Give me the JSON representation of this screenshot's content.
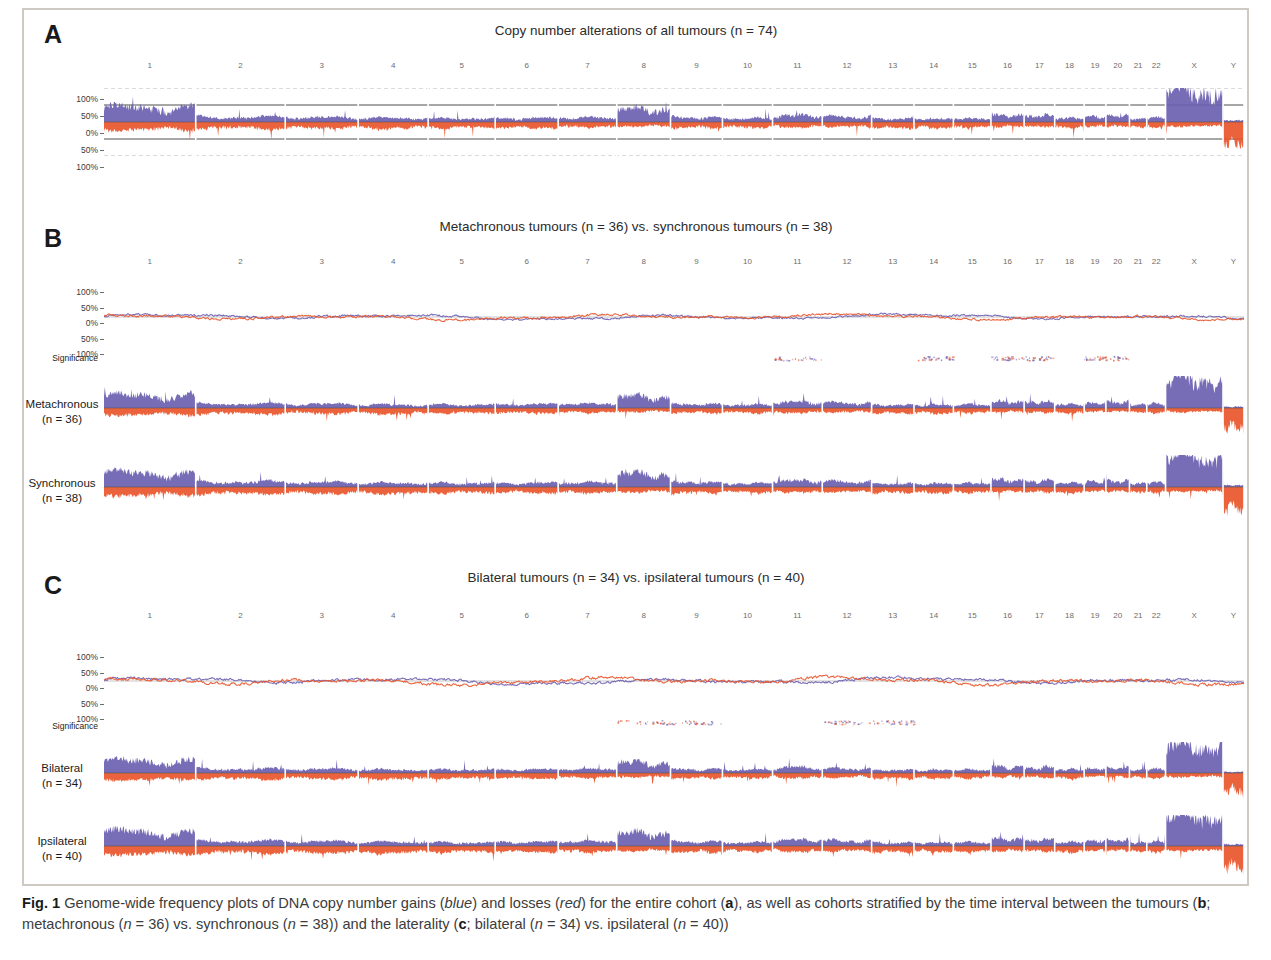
{
  "figure": {
    "caption_label": "Fig. 1",
    "caption_text_1": " Genome-wide frequency plots of DNA copy number gains (",
    "caption_blue": "blue",
    "caption_text_2": ") and losses (",
    "caption_red": "red",
    "caption_text_3": ") for the entire cohort (",
    "caption_a": "a",
    "caption_text_4": "), as well as cohorts stratified by the time interval between the tumours (",
    "caption_b": "b",
    "caption_text_5": "; metachronous (",
    "caption_n1": "n",
    "caption_text_6": " = 36) vs. synchronous (",
    "caption_n2": "n",
    "caption_text_7": " = 38)) and the laterality (",
    "caption_c": "c",
    "caption_text_8": "; bilateral (",
    "caption_n3": "n",
    "caption_text_9": " = 34) vs. ipsilateral (",
    "caption_n4": "n",
    "caption_text_10": " = 40))"
  },
  "colors": {
    "gain": "#6b5fb0",
    "loss": "#e8562d",
    "axis": "#6d6d6d",
    "gridline": "#4a4a4a",
    "text": "#231f20"
  },
  "panels": [
    {
      "letter": "A",
      "title": "Copy number alterations of all tumours (n = 74)",
      "y_labels": [
        "100%",
        "50%",
        "0%",
        "50%",
        "100%"
      ]
    },
    {
      "letter": "B",
      "title": "Metachronous tumours (n = 36) vs. synchronous tumours (n = 38)",
      "y_labels": [
        "100%",
        "50%",
        "0%",
        "50%",
        "100%"
      ],
      "significance_label": "Significance",
      "rows": [
        {
          "name": "Metachronous",
          "n": "(n = 36)"
        },
        {
          "name": "Synchronous",
          "n": "(n = 38)"
        }
      ]
    },
    {
      "letter": "C",
      "title": "Bilateral tumours (n = 34) vs. ipsilateral tumours (n = 40)",
      "y_labels": [
        "100%",
        "50%",
        "0%",
        "50%",
        "100%"
      ],
      "significance_label": "Significance",
      "rows": [
        {
          "name": "Bilateral",
          "n": "(n = 34)"
        },
        {
          "name": "Ipsilateral",
          "n": "(n = 40)"
        }
      ]
    }
  ],
  "chart_data": {
    "type": "area",
    "xlabel": "Chromosome",
    "ylabel": "Frequency (%)",
    "ylim": [
      -100,
      100
    ],
    "grid": true,
    "legend": [
      "gains (blue)",
      "losses (red)"
    ],
    "chromosomes": [
      "1",
      "2",
      "3",
      "4",
      "5",
      "6",
      "7",
      "8",
      "9",
      "10",
      "11",
      "12",
      "13",
      "14",
      "15",
      "16",
      "17",
      "18",
      "19",
      "20",
      "21",
      "22",
      "X",
      "Y"
    ],
    "chromosome_lengths_mb": [
      249,
      243,
      198,
      190,
      182,
      171,
      159,
      146,
      141,
      136,
      135,
      134,
      115,
      107,
      102,
      90,
      83,
      80,
      59,
      64,
      47,
      51,
      156,
      57
    ],
    "series": [
      {
        "name": "All tumours (n = 74) gains",
        "panel": "A",
        "unit": "percent",
        "per_chromosome_mean": [
          40,
          14,
          13,
          11,
          10,
          11,
          12,
          36,
          13,
          10,
          18,
          15,
          9,
          9,
          10,
          20,
          18,
          11,
          14,
          17,
          10,
          13,
          88,
          4
        ]
      },
      {
        "name": "All tumours (n = 74) losses",
        "panel": "A",
        "unit": "percent",
        "per_chromosome_mean": [
          -22,
          -18,
          -17,
          -18,
          -16,
          -16,
          -14,
          -12,
          -16,
          -15,
          -15,
          -13,
          -16,
          -16,
          -15,
          -13,
          -14,
          -16,
          -12,
          -12,
          -14,
          -16,
          -12,
          -62
        ]
      },
      {
        "name": "Metachronous (n = 36) minus Synchronous (n = 38) difference",
        "panel": "B-top",
        "unit": "percent",
        "range": [
          -14,
          16
        ]
      },
      {
        "name": "Metachronous (n = 36) gains",
        "panel": "B",
        "unit": "percent",
        "per_chromosome_mean": [
          38,
          13,
          12,
          10,
          10,
          11,
          12,
          34,
          12,
          10,
          17,
          15,
          9,
          9,
          10,
          19,
          18,
          11,
          14,
          17,
          10,
          13,
          86,
          4
        ]
      },
      {
        "name": "Metachronous (n = 36) losses",
        "panel": "B",
        "unit": "percent",
        "per_chromosome_mean": [
          -20,
          -17,
          -16,
          -17,
          -15,
          -15,
          -13,
          -11,
          -15,
          -14,
          -14,
          -12,
          -15,
          -15,
          -14,
          -12,
          -13,
          -15,
          -11,
          -11,
          -13,
          -15,
          -11,
          -58
        ]
      },
      {
        "name": "Synchronous (n = 38) gains",
        "panel": "B",
        "unit": "percent",
        "per_chromosome_mean": [
          42,
          15,
          14,
          12,
          11,
          12,
          13,
          38,
          14,
          11,
          19,
          16,
          10,
          10,
          11,
          21,
          19,
          12,
          15,
          18,
          11,
          14,
          90,
          5
        ]
      },
      {
        "name": "Synchronous (n = 38) losses",
        "panel": "B",
        "unit": "percent",
        "per_chromosome_mean": [
          -24,
          -20,
          -19,
          -20,
          -17,
          -17,
          -16,
          -14,
          -18,
          -16,
          -16,
          -14,
          -17,
          -17,
          -16,
          -14,
          -15,
          -17,
          -13,
          -13,
          -15,
          -17,
          -13,
          -66
        ]
      },
      {
        "name": "Bilateral (n = 34) minus Ipsilateral (n = 40) difference",
        "panel": "C-top",
        "unit": "percent",
        "range": [
          -18,
          22
        ]
      },
      {
        "name": "Bilateral (n = 34) gains",
        "panel": "C",
        "unit": "percent",
        "per_chromosome_mean": [
          37,
          13,
          12,
          10,
          10,
          11,
          12,
          32,
          12,
          10,
          17,
          14,
          9,
          9,
          10,
          19,
          17,
          11,
          13,
          16,
          10,
          13,
          85,
          4
        ]
      },
      {
        "name": "Bilateral (n = 34) losses",
        "panel": "C",
        "unit": "percent",
        "per_chromosome_mean": [
          -21,
          -18,
          -17,
          -18,
          -16,
          -16,
          -14,
          -12,
          -16,
          -15,
          -15,
          -13,
          -16,
          -16,
          -15,
          -13,
          -14,
          -16,
          -12,
          -12,
          -14,
          -16,
          -12,
          -60
        ]
      },
      {
        "name": "Ipsilateral (n = 40) gains",
        "panel": "C",
        "unit": "percent",
        "per_chromosome_mean": [
          43,
          15,
          14,
          12,
          11,
          12,
          14,
          40,
          14,
          11,
          19,
          16,
          10,
          10,
          11,
          22,
          19,
          12,
          15,
          18,
          11,
          14,
          91,
          5
        ]
      },
      {
        "name": "Ipsilateral (n = 40) losses",
        "panel": "C",
        "unit": "percent",
        "per_chromosome_mean": [
          -25,
          -21,
          -20,
          -21,
          -18,
          -18,
          -17,
          -15,
          -19,
          -17,
          -17,
          -15,
          -18,
          -18,
          -17,
          -15,
          -16,
          -18,
          -14,
          -14,
          -16,
          -18,
          -14,
          -68
        ]
      }
    ],
    "significance_rows": [
      {
        "panel": "B",
        "label": "Significance",
        "marks_chromosomes": [
          "11",
          "14",
          "16",
          "17",
          "19",
          "20"
        ]
      },
      {
        "panel": "C",
        "label": "Significance",
        "marks_chromosomes": [
          "8",
          "9",
          "12",
          "13"
        ]
      }
    ]
  }
}
